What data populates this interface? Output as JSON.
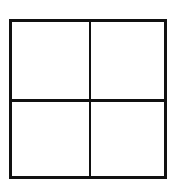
{
  "diagram": {
    "type": "grid",
    "rows": 2,
    "columns": 2,
    "cells": [
      {
        "row": 0,
        "col": 0,
        "label": ""
      },
      {
        "row": 0,
        "col": 1,
        "label": ""
      },
      {
        "row": 1,
        "col": 0,
        "label": ""
      },
      {
        "row": 1,
        "col": 1,
        "label": ""
      }
    ],
    "line_color": "#111111",
    "background_color": "#ffffff"
  }
}
